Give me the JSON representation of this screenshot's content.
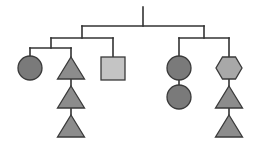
{
  "diagram": {
    "type": "tree",
    "width": 255,
    "height": 149,
    "colors": {
      "background": "#ffffff",
      "line": "#333333",
      "circle": "#7a7a7a",
      "triangle": "#8c8c8c",
      "square": "#c4c4c4",
      "hexagon": "#a8a8a8",
      "stroke": "#3a3a3a"
    },
    "lines": [
      {
        "id": "root-stem",
        "x1": 143,
        "y1": 7,
        "x2": 143,
        "y2": 26
      },
      {
        "id": "level1-bar",
        "x1": 82,
        "y1": 26,
        "x2": 204,
        "y2": 26
      },
      {
        "id": "left-drop",
        "x1": 82,
        "y1": 26,
        "x2": 82,
        "y2": 38
      },
      {
        "id": "right-drop",
        "x1": 204,
        "y1": 26,
        "x2": 204,
        "y2": 38
      },
      {
        "id": "left-bar",
        "x1": 51,
        "y1": 38,
        "x2": 113,
        "y2": 38
      },
      {
        "id": "left-sub-drop",
        "x1": 51,
        "y1": 38,
        "x2": 51,
        "y2": 48
      },
      {
        "id": "square-drop",
        "x1": 113,
        "y1": 38,
        "x2": 113,
        "y2": 57
      },
      {
        "id": "left-sub-bar",
        "x1": 30,
        "y1": 48,
        "x2": 71,
        "y2": 48
      },
      {
        "id": "circle-drop",
        "x1": 30,
        "y1": 48,
        "x2": 30,
        "y2": 57
      },
      {
        "id": "triangle-drop",
        "x1": 71,
        "y1": 48,
        "x2": 71,
        "y2": 57
      },
      {
        "id": "tri-link-1",
        "x1": 71,
        "y1": 79,
        "x2": 71,
        "y2": 86
      },
      {
        "id": "tri-link-2",
        "x1": 71,
        "y1": 108,
        "x2": 71,
        "y2": 115
      },
      {
        "id": "right-bar",
        "x1": 179,
        "y1": 38,
        "x2": 229,
        "y2": 38
      },
      {
        "id": "right-circle-drop",
        "x1": 179,
        "y1": 38,
        "x2": 179,
        "y2": 57
      },
      {
        "id": "hex-drop",
        "x1": 229,
        "y1": 38,
        "x2": 229,
        "y2": 57
      },
      {
        "id": "circle-link",
        "x1": 179,
        "y1": 80,
        "x2": 179,
        "y2": 86
      },
      {
        "id": "hex-link",
        "x1": 229,
        "y1": 79,
        "x2": 229,
        "y2": 86
      },
      {
        "id": "right-tri-link",
        "x1": 229,
        "y1": 108,
        "x2": 229,
        "y2": 115
      }
    ],
    "nodes": [
      {
        "id": "circle-left",
        "shape": "circle",
        "cx": 30,
        "cy": 68,
        "r": 12
      },
      {
        "id": "triangle-left-1",
        "shape": "triangle",
        "cx": 71,
        "top": 57,
        "bottom": 79,
        "half_width": 13.5
      },
      {
        "id": "triangle-left-2",
        "shape": "triangle",
        "cx": 71,
        "top": 86,
        "bottom": 108,
        "half_width": 13.5
      },
      {
        "id": "triangle-left-3",
        "shape": "triangle",
        "cx": 71,
        "top": 115,
        "bottom": 137,
        "half_width": 13.5
      },
      {
        "id": "square-middle",
        "shape": "square",
        "x": 101,
        "y": 57,
        "w": 24,
        "h": 23
      },
      {
        "id": "circle-right-1",
        "shape": "circle",
        "cx": 179,
        "cy": 68,
        "r": 12
      },
      {
        "id": "circle-right-2",
        "shape": "circle",
        "cx": 179,
        "cy": 97,
        "r": 12
      },
      {
        "id": "hexagon-right",
        "shape": "hexagon",
        "cx": 229,
        "cy": 68,
        "half_width": 13,
        "half_height": 11
      },
      {
        "id": "triangle-right-1",
        "shape": "triangle",
        "cx": 229,
        "top": 86,
        "bottom": 108,
        "half_width": 13.5
      },
      {
        "id": "triangle-right-2",
        "shape": "triangle",
        "cx": 229,
        "top": 115,
        "bottom": 137,
        "half_width": 13.5
      }
    ]
  }
}
